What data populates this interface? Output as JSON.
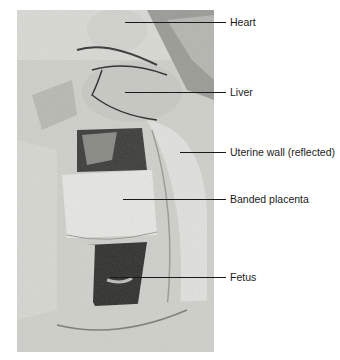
{
  "figure": {
    "image_description": "Grayscale dissection photograph of opened uterus showing fetus with banded placenta",
    "labels": [
      {
        "text": "Heart",
        "y": 22,
        "line_start_x": 125
      },
      {
        "text": "Liver",
        "y": 92,
        "line_start_x": 125
      },
      {
        "text": "Uterine wall (reflected)",
        "y": 152,
        "line_start_x": 180
      },
      {
        "text": "Banded placenta",
        "y": 199,
        "line_start_x": 123
      },
      {
        "text": "Fetus",
        "y": 277,
        "line_start_x": 110
      }
    ],
    "line_end_x": 226,
    "label_x": 230
  }
}
